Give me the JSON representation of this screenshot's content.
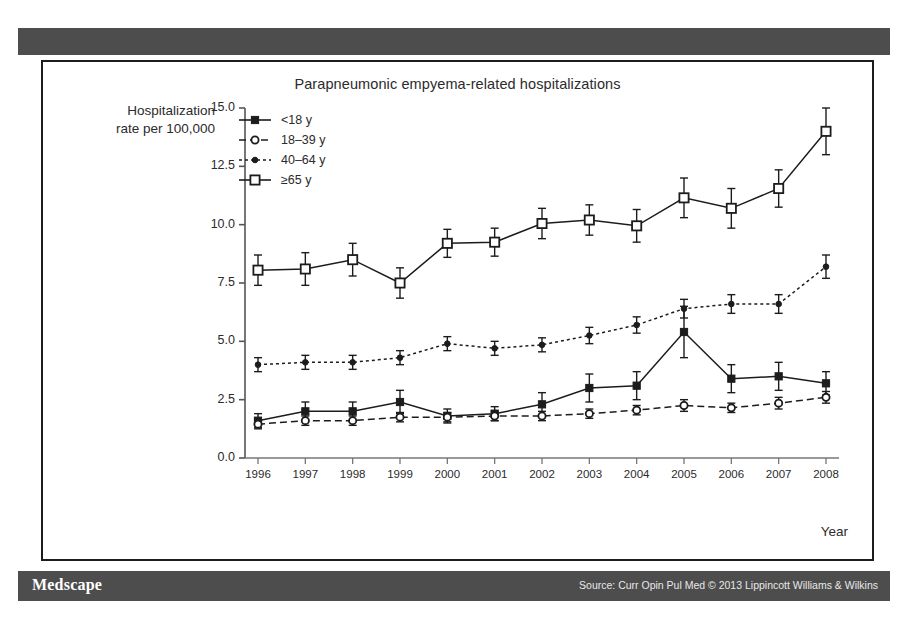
{
  "header": {
    "bar_label": ""
  },
  "footer": {
    "brand": "Medscape",
    "source": "Source: Curr Opin Pul Med © 2013 Lippincott Williams & Wilkins"
  },
  "chart_data": {
    "type": "line",
    "title": "Parapneumonic empyema-related hospitalizations",
    "xlabel": "Year",
    "ylabel": "Hospitalization rate per 100,000",
    "ylabel_line1": "Hospitalization",
    "ylabel_line2": "rate per 100,000",
    "grid": false,
    "legend_position": "top-left-inside",
    "xlim": [
      1996,
      2008
    ],
    "ylim": [
      0.0,
      15.0
    ],
    "ytick_labels": [
      "15.0",
      "12.5",
      "10.0",
      "7.5",
      "5.0",
      "2.5",
      "0.0"
    ],
    "ytick_values": [
      15.0,
      12.5,
      10.0,
      7.5,
      5.0,
      2.5,
      0.0
    ],
    "categories": [
      1996,
      1997,
      1998,
      1999,
      2000,
      2001,
      2002,
      2003,
      2004,
      2005,
      2006,
      2007,
      2008
    ],
    "xtick_labels": [
      "1996",
      "1997",
      "1998",
      "1999",
      "2000",
      "2001",
      "2002",
      "2003",
      "2004",
      "2005",
      "2006",
      "2007",
      "2008"
    ],
    "error_bars": true,
    "series": [
      {
        "name": "<18 y",
        "marker": "filled-square",
        "line": "solid",
        "color": "#1c1c1c",
        "values": [
          1.6,
          2.0,
          2.0,
          2.4,
          1.8,
          1.9,
          2.3,
          3.0,
          3.1,
          5.4,
          3.4,
          3.5,
          3.2
        ],
        "err_low": [
          1.3,
          1.6,
          1.6,
          1.9,
          1.5,
          1.6,
          1.8,
          2.4,
          2.5,
          4.3,
          2.8,
          2.9,
          2.7
        ],
        "err_high": [
          1.9,
          2.4,
          2.4,
          2.9,
          2.1,
          2.2,
          2.8,
          3.6,
          3.7,
          6.5,
          4.0,
          4.1,
          3.7
        ]
      },
      {
        "name": "18–39 y",
        "marker": "open-circle",
        "line": "dashed",
        "color": "#1c1c1c",
        "values": [
          1.45,
          1.6,
          1.6,
          1.75,
          1.75,
          1.8,
          1.8,
          1.9,
          2.05,
          2.25,
          2.15,
          2.35,
          2.6
        ],
        "err_low": [
          1.25,
          1.4,
          1.4,
          1.55,
          1.55,
          1.6,
          1.6,
          1.7,
          1.85,
          2.0,
          1.95,
          2.1,
          2.35
        ],
        "err_high": [
          1.65,
          1.8,
          1.8,
          1.95,
          1.95,
          2.0,
          2.0,
          2.1,
          2.25,
          2.5,
          2.35,
          2.6,
          2.85
        ]
      },
      {
        "name": "40–64 y",
        "marker": "small-dot",
        "line": "dotted",
        "color": "#1c1c1c",
        "values": [
          4.0,
          4.1,
          4.1,
          4.3,
          4.9,
          4.7,
          4.85,
          5.25,
          5.7,
          6.4,
          6.6,
          6.6,
          8.2
        ],
        "err_low": [
          3.7,
          3.8,
          3.8,
          4.0,
          4.6,
          4.4,
          4.55,
          4.9,
          5.35,
          6.0,
          6.2,
          6.2,
          7.7
        ],
        "err_high": [
          4.3,
          4.4,
          4.4,
          4.6,
          5.2,
          5.0,
          5.15,
          5.6,
          6.05,
          6.8,
          7.0,
          7.0,
          8.7
        ]
      },
      {
        "name": "≥65 y",
        "marker": "open-square",
        "line": "solid",
        "color": "#1c1c1c",
        "values": [
          8.05,
          8.1,
          8.5,
          7.5,
          9.2,
          9.25,
          10.05,
          10.2,
          9.95,
          11.15,
          10.7,
          11.55,
          14.0
        ],
        "err_low": [
          7.4,
          7.4,
          7.8,
          6.85,
          8.6,
          8.65,
          9.4,
          9.55,
          9.25,
          10.3,
          9.85,
          10.75,
          13.0
        ],
        "err_high": [
          8.7,
          8.8,
          9.2,
          8.15,
          9.8,
          9.85,
          10.7,
          10.85,
          10.65,
          12.0,
          11.55,
          12.35,
          15.0
        ]
      }
    ]
  }
}
